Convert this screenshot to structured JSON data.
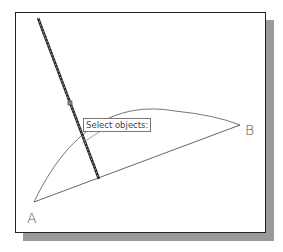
{
  "viewport": {
    "background": "#ffffff",
    "shadow_color": "#9a9a9a"
  },
  "points": {
    "A": {
      "label": "A"
    },
    "B": {
      "label": "B"
    }
  },
  "tooltip": {
    "text": "Select objects:"
  },
  "entities": [
    {
      "type": "line",
      "name": "line-AB",
      "highlighted": false
    },
    {
      "type": "arc",
      "name": "arc-AB",
      "highlighted": false
    },
    {
      "type": "line",
      "name": "selected-line",
      "highlighted": true
    }
  ],
  "colors": {
    "line": "#555555",
    "highlight": "#333333",
    "grip": "#666666"
  }
}
